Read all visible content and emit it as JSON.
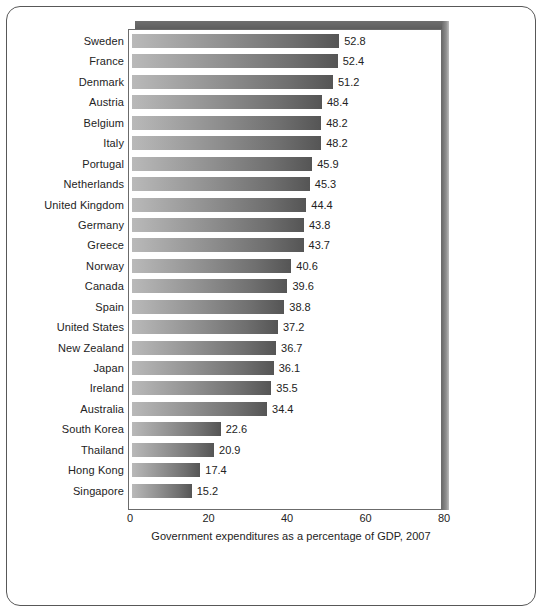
{
  "chart_data": {
    "type": "bar",
    "orientation": "horizontal",
    "title": "",
    "xlabel": "Government expenditures as a percentage of GDP, 2007",
    "ylabel": "",
    "xlim": [
      0,
      80
    ],
    "xticks": [
      0,
      20,
      40,
      60,
      80
    ],
    "grid": false,
    "legend": null,
    "categories": [
      "Sweden",
      "France",
      "Denmark",
      "Austria",
      "Belgium",
      "Italy",
      "Portugal",
      "Netherlands",
      "United Kingdom",
      "Germany",
      "Greece",
      "Norway",
      "Canada",
      "Spain",
      "United States",
      "New Zealand",
      "Japan",
      "Ireland",
      "Australia",
      "South Korea",
      "Thailand",
      "Hong Kong",
      "Singapore"
    ],
    "values": [
      52.8,
      52.4,
      51.2,
      48.4,
      48.2,
      48.2,
      45.9,
      45.3,
      44.4,
      43.8,
      43.7,
      40.6,
      39.6,
      38.8,
      37.2,
      36.7,
      36.1,
      35.5,
      34.4,
      22.6,
      20.9,
      17.4,
      15.2
    ],
    "value_labels": [
      "52.8",
      "52.4",
      "51.2",
      "48.4",
      "48.2",
      "48.2",
      "45.9",
      "45.3",
      "44.4",
      "43.8",
      "43.7",
      "40.6",
      "39.6",
      "38.8",
      "37.2",
      "36.7",
      "36.1",
      "35.5",
      "34.4",
      "22.6",
      "20.9",
      "17.4",
      "15.2"
    ],
    "xtick_labels": [
      "0",
      "20",
      "40",
      "60",
      "80"
    ],
    "colors": {
      "bar_gradient_start": "#b9b9b9",
      "bar_gradient_end": "#555555",
      "plot_border": "#6b6b6b",
      "shadow_band": "#5c5c5c",
      "text": "#232323",
      "background": "#ffffff"
    }
  }
}
